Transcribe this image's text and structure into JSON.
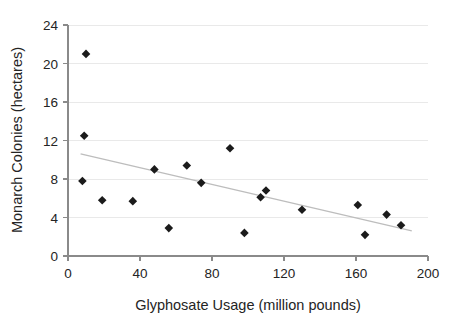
{
  "chart_data": {
    "type": "scatter",
    "title": "",
    "xlabel": "Glyphosate Usage (million pounds)",
    "ylabel": "Monarch Colonies (hectares)",
    "xlim": [
      0,
      200
    ],
    "ylim": [
      0,
      24
    ],
    "xticks": [
      0,
      40,
      80,
      120,
      160,
      200
    ],
    "yticks": [
      0,
      4,
      8,
      12,
      16,
      20,
      24
    ],
    "xtick_labels": [
      "0",
      "40",
      "80",
      "120",
      "160",
      "200"
    ],
    "ytick_labels": [
      "0",
      "4",
      "8",
      "12",
      "16",
      "20",
      "24"
    ],
    "grid": "horizontal",
    "legend": "none",
    "marker": "diamond",
    "marker_color": "#1b1b1b",
    "trendline_color": "#bdbdbd",
    "series": [
      {
        "name": "Monarch colonies vs glyphosate usage",
        "points": [
          {
            "x": 10,
            "y": 21.0
          },
          {
            "x": 9,
            "y": 12.5
          },
          {
            "x": 8,
            "y": 7.8
          },
          {
            "x": 19,
            "y": 5.8
          },
          {
            "x": 36,
            "y": 5.7
          },
          {
            "x": 48,
            "y": 9.0
          },
          {
            "x": 56,
            "y": 2.9
          },
          {
            "x": 66,
            "y": 9.4
          },
          {
            "x": 74,
            "y": 7.6
          },
          {
            "x": 90,
            "y": 11.2
          },
          {
            "x": 98,
            "y": 2.4
          },
          {
            "x": 107,
            "y": 6.1
          },
          {
            "x": 110,
            "y": 6.8
          },
          {
            "x": 130,
            "y": 4.8
          },
          {
            "x": 161,
            "y": 5.3
          },
          {
            "x": 165,
            "y": 2.2
          },
          {
            "x": 177,
            "y": 4.3
          },
          {
            "x": 185,
            "y": 3.2
          }
        ]
      }
    ],
    "trendline": {
      "label": "linear fit",
      "x_start": 7,
      "y_start": 10.6,
      "x_end": 191,
      "y_end": 2.6
    }
  }
}
